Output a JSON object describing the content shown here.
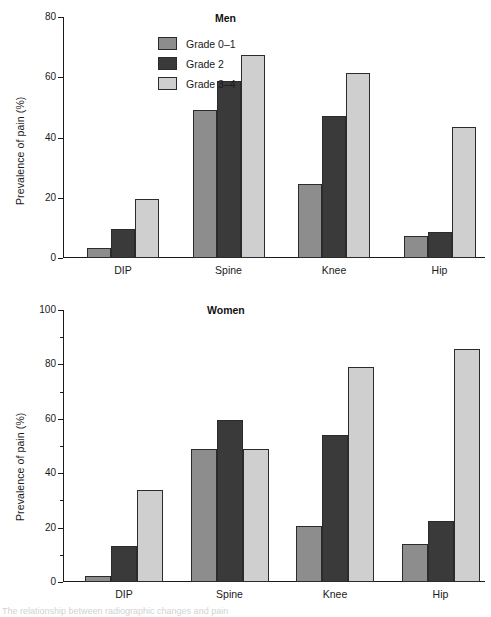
{
  "figure": {
    "ylabel": "Prevalence of pain (%)",
    "caption": "The relationship between radiographic changes and pain"
  },
  "legend": {
    "position": "top-left",
    "items": [
      {
        "label": "Grade 0–1",
        "color": "#8d8d8d"
      },
      {
        "label": "Grade 2",
        "color": "#3a3a3a"
      },
      {
        "label": "Grade 3–4",
        "color": "#cfcfcf"
      }
    ]
  },
  "chart_data": [
    {
      "type": "bar",
      "title": "Men",
      "xlabel": "",
      "ylabel": "Prevalence of pain (%)",
      "ylim": [
        0,
        80
      ],
      "yticks": [
        0,
        20,
        40,
        60,
        80
      ],
      "ytick_labels": [
        "0",
        "20",
        "40",
        "60",
        "80"
      ],
      "grid": false,
      "legend_position": "upper left",
      "categories": [
        "DIP",
        "Spine",
        "Knee",
        "Hip"
      ],
      "series": [
        {
          "name": "Grade 0–1",
          "color": "#8d8d8d",
          "values": [
            3.2,
            49.0,
            24.6,
            7.3
          ]
        },
        {
          "name": "Grade 2",
          "color": "#3a3a3a",
          "values": [
            9.5,
            58.8,
            47.0,
            8.5
          ]
        },
        {
          "name": "Grade 3–4",
          "color": "#cfcfcf",
          "values": [
            19.5,
            67.5,
            61.5,
            43.5
          ]
        }
      ]
    },
    {
      "type": "bar",
      "title": "Women",
      "xlabel": "",
      "ylabel": "Prevalence of pain (%)",
      "ylim": [
        0,
        100
      ],
      "yticks": [
        0,
        20,
        40,
        60,
        80,
        100
      ],
      "ytick_labels": [
        "0",
        "20",
        "40",
        "60",
        "80",
        "100"
      ],
      "yticks_minor": [
        10,
        30,
        50,
        70,
        90
      ],
      "grid": false,
      "legend_position": "none",
      "categories": [
        "DIP",
        "Spine",
        "Knee",
        "Hip"
      ],
      "series": [
        {
          "name": "Grade 0–1",
          "color": "#8d8d8d",
          "values": [
            2.2,
            48.8,
            20.6,
            13.8
          ]
        },
        {
          "name": "Grade 2",
          "color": "#3a3a3a",
          "values": [
            13.2,
            59.7,
            54.0,
            22.6
          ]
        },
        {
          "name": "Grade 3–4",
          "color": "#cfcfcf",
          "values": [
            33.8,
            48.8,
            79.0,
            85.5
          ]
        }
      ]
    }
  ]
}
